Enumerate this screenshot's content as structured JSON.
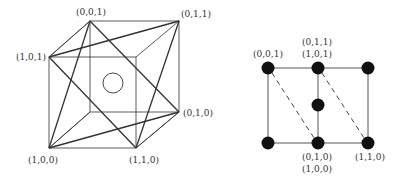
{
  "left_diagram": {
    "title": "cube with diagonal tetrahedra",
    "labels": {
      "v001": "(0,0,1)",
      "v011": "(0,1,1)",
      "v101": "(1,0,1)",
      "v010": "(0,1,0)",
      "v100": "(1,0,0)",
      "v110": "(1,1,0)"
    }
  },
  "right_diagram": {
    "title": "projected lattice with dots",
    "labels": {
      "top_left": "(0,0,1)",
      "top_mid_1": "(0,1,1)",
      "top_mid_2": "(1,0,1)",
      "bottom_mid_1": "(0,1,0)",
      "bottom_mid_2": "(1,0,0)",
      "bottom_right": "(1,1,0)"
    }
  },
  "colors": {
    "line": "#333333",
    "dot": "#111111",
    "background": "#ffffff"
  }
}
